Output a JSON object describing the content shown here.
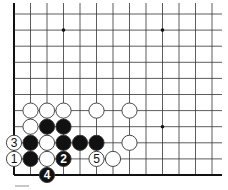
{
  "diagram": {
    "type": "go-board-fragment",
    "origin_x": 14,
    "origin_y": 14,
    "spacing_x": 16.5,
    "spacing_y": 16.1,
    "columns": 13,
    "rows": 11,
    "right_extent": 222,
    "top_extent": 3,
    "edges": [
      "left",
      "bottom"
    ],
    "star_points": [
      {
        "col": 3,
        "row": 1
      },
      {
        "col": 9,
        "row": 1
      },
      {
        "col": 9,
        "row": 7
      }
    ],
    "stones": [
      {
        "col": 1,
        "row": 6,
        "color": "white",
        "label": ""
      },
      {
        "col": 2,
        "row": 6,
        "color": "white",
        "label": ""
      },
      {
        "col": 3,
        "row": 6,
        "color": "white",
        "label": ""
      },
      {
        "col": 5,
        "row": 6,
        "color": "white",
        "label": ""
      },
      {
        "col": 7,
        "row": 6,
        "color": "white",
        "label": ""
      },
      {
        "col": 1,
        "row": 7,
        "color": "white",
        "label": ""
      },
      {
        "col": 2,
        "row": 7,
        "color": "black",
        "label": ""
      },
      {
        "col": 3,
        "row": 7,
        "color": "black",
        "label": ""
      },
      {
        "col": 0,
        "row": 8,
        "color": "white",
        "label": "3"
      },
      {
        "col": 1,
        "row": 8,
        "color": "black",
        "label": ""
      },
      {
        "col": 2,
        "row": 8,
        "color": "white",
        "label": ""
      },
      {
        "col": 3,
        "row": 8,
        "color": "black",
        "label": ""
      },
      {
        "col": 4,
        "row": 8,
        "color": "black",
        "label": ""
      },
      {
        "col": 5,
        "row": 8,
        "color": "black",
        "label": ""
      },
      {
        "col": 7,
        "row": 8,
        "color": "white",
        "label": ""
      },
      {
        "col": 0,
        "row": 9,
        "color": "white",
        "label": "1"
      },
      {
        "col": 1,
        "row": 9,
        "color": "black",
        "label": ""
      },
      {
        "col": 2,
        "row": 9,
        "color": "white",
        "label": ""
      },
      {
        "col": 3,
        "row": 9,
        "color": "black",
        "label": "2"
      },
      {
        "col": 5,
        "row": 9,
        "color": "white",
        "label": "5"
      },
      {
        "col": 6,
        "row": 9,
        "color": "white",
        "label": ""
      },
      {
        "col": 2,
        "row": 10,
        "color": "black",
        "label": "4"
      }
    ],
    "colors": {
      "line": "#333333",
      "edge": "#111111",
      "black_stone": "#111111",
      "white_stone": "#ffffff",
      "stone_outline": "#333333"
    }
  }
}
